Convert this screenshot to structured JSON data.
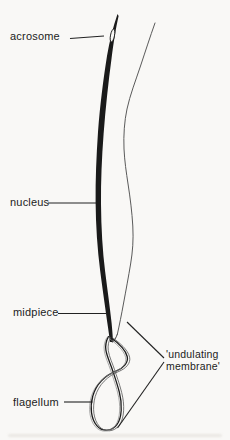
{
  "figure": {
    "background_color": "#f9f8f6",
    "ink_color": "#1a1a1a",
    "membrane_line_color": "#5a5a5a",
    "labels": {
      "acrosome": "acrosome",
      "nucleus": "nucleus",
      "midpiece": "midpiece",
      "flagellum": "flagellum",
      "undulating_membrane_line1": "'undulating",
      "undulating_membrane_line2": "membrane'"
    }
  }
}
